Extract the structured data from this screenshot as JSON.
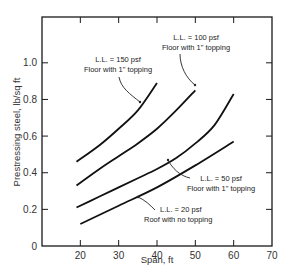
{
  "chart_data": {
    "type": "line",
    "title": "",
    "xlabel": "Span, ft",
    "ylabel": "Prestressing steel, lb/sq ft",
    "xlim": [
      10,
      70
    ],
    "ylim": [
      0,
      1.25
    ],
    "xticks": [
      20,
      30,
      40,
      50,
      60,
      70
    ],
    "xtick_labels": [
      "20",
      "30",
      "40",
      "50",
      "60",
      "70"
    ],
    "yticks": [
      0,
      0.2,
      0.4,
      0.6,
      0.8,
      1.0
    ],
    "ytick_labels": [
      "0",
      "0.2",
      "0.4",
      "0.6",
      "0.8",
      "1.0"
    ],
    "grid": false,
    "legend": "annotations",
    "series": [
      {
        "name": "L.L. = 150 psf, Floor with 1\" topping",
        "label_line1": "L.L. = 150 psf",
        "label_line2": "Floor with 1\" topping",
        "x": [
          19,
          25,
          30,
          35,
          40
        ],
        "y": [
          0.46,
          0.55,
          0.64,
          0.74,
          0.89
        ]
      },
      {
        "name": "L.L. = 100 psf, Floor with 1\" topping",
        "label_line1": "L.L. = 100 psf",
        "label_line2": "Floor with 1\" topping",
        "x": [
          19,
          25,
          30,
          35,
          40,
          45,
          50
        ],
        "y": [
          0.33,
          0.42,
          0.49,
          0.56,
          0.64,
          0.74,
          0.85
        ]
      },
      {
        "name": "L.L. = 50 psf, Floor with 1\" topping",
        "label_line1": "L.L. = 50 psf",
        "label_line2": "Floor with 1\" topping",
        "x": [
          19,
          25,
          30,
          35,
          40,
          45,
          50,
          55,
          60
        ],
        "y": [
          0.21,
          0.27,
          0.32,
          0.37,
          0.42,
          0.48,
          0.56,
          0.66,
          0.83
        ]
      },
      {
        "name": "L.L. = 20 psf, Roof with no topping",
        "label_line1": "L.L. = 20 psf",
        "label_line2": "Roof with no topping",
        "x": [
          20,
          30,
          40,
          50,
          60
        ],
        "y": [
          0.12,
          0.22,
          0.32,
          0.44,
          0.57
        ]
      }
    ]
  }
}
